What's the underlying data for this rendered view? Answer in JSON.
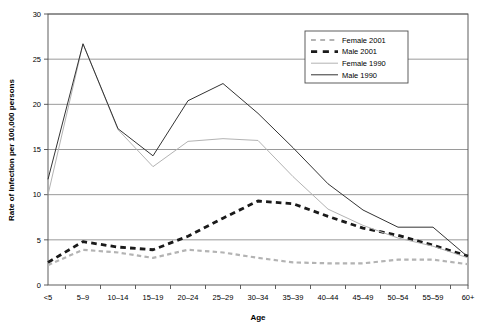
{
  "chart_data": {
    "type": "line",
    "title": "",
    "xlabel": "Age",
    "ylabel": "Rate of Infection per 100,000 persons",
    "categories": [
      "<5",
      "5–9",
      "10–14",
      "15–19",
      "20–24",
      "25–29",
      "30–34",
      "35–39",
      "40–44",
      "45–49",
      "50–54",
      "55–59",
      "60+"
    ],
    "ylim": [
      0,
      30
    ],
    "yticks": [
      0,
      5,
      10,
      15,
      20,
      25,
      30
    ],
    "ytick_labels": [
      "0",
      "5",
      "10",
      "15",
      "20",
      "25",
      "30"
    ],
    "grid": "horizontal",
    "legend_position": "top-right",
    "series": [
      {
        "name": "Female 2001",
        "color": "#b3b3b3",
        "style": "dashed",
        "width": 2.2,
        "values": [
          2.2,
          3.9,
          3.6,
          3.0,
          3.9,
          3.6,
          3.0,
          2.5,
          2.4,
          2.4,
          2.8,
          2.8,
          2.3
        ]
      },
      {
        "name": "Male 2001",
        "color": "#1a1a1a",
        "style": "dashed",
        "width": 2.8,
        "values": [
          2.5,
          4.8,
          4.2,
          3.9,
          5.4,
          7.4,
          9.3,
          9.0,
          7.6,
          6.3,
          5.5,
          4.4,
          3.2
        ]
      },
      {
        "name": "Female 1990",
        "color": "#b3b3b3",
        "style": "solid",
        "width": 1.0,
        "values": [
          10.0,
          26.7,
          17.2,
          13.1,
          15.9,
          16.2,
          16.0,
          12.0,
          8.4,
          6.6,
          5.2,
          4.3,
          3.0
        ]
      },
      {
        "name": "Male 1990",
        "color": "#333333",
        "style": "solid",
        "width": 1.0,
        "values": [
          11.7,
          26.7,
          17.3,
          14.3,
          20.4,
          22.3,
          19.0,
          15.2,
          11.2,
          8.3,
          6.4,
          6.4,
          3.1
        ]
      }
    ]
  },
  "legend": {
    "items": [
      {
        "label": "Female 2001"
      },
      {
        "label": "Male 2001"
      },
      {
        "label": "Female 1990"
      },
      {
        "label": "Male 1990"
      }
    ]
  }
}
